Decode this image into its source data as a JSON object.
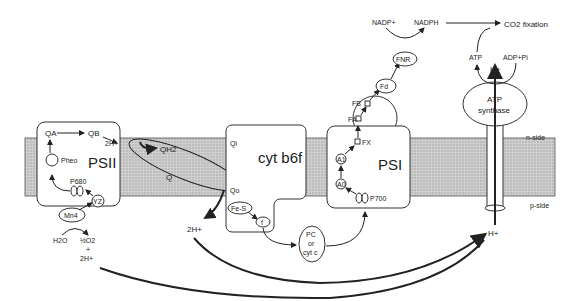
{
  "complexes": {
    "psii": {
      "name": "PSII",
      "qa": "QA",
      "qb": "QB",
      "pheo": "Pheo",
      "p680": "P680",
      "yz": "YZ",
      "mn": "Mn4"
    },
    "cytb6f": {
      "name": "cyt b6f",
      "qi": "Qi",
      "qo": "Qo",
      "fes": "Fe-S",
      "f": "f"
    },
    "psi": {
      "name": "PSI",
      "a0": "A0",
      "a1": "A1",
      "fx": "FX",
      "fa": "FA",
      "fb": "FB",
      "p700": "P700"
    },
    "atp_synthase": {
      "name_line1": "ATP",
      "name_line2": "synthase"
    }
  },
  "mobile_carriers": {
    "qh2": "QH2",
    "q": "Q",
    "pc": {
      "line1": "PC",
      "line2": "or",
      "line3": "cyt c"
    },
    "fd": "Fd",
    "fnr": "FNR"
  },
  "labels": {
    "two_h_top": "2H+",
    "two_h_mid": "2H+",
    "two_h_bottom": "2H+",
    "h2o": "H2O",
    "half_o2": "½O2",
    "plus": "+",
    "nadp": "NADP+",
    "nadph": "NADPH",
    "co2_fixation": "CO2 fixation",
    "atp": "ATP",
    "adp_pi": "ADP+Pi",
    "h_top": "H+",
    "h_bottom": "H+",
    "n_side": "n-side",
    "p_side": "p-side"
  }
}
